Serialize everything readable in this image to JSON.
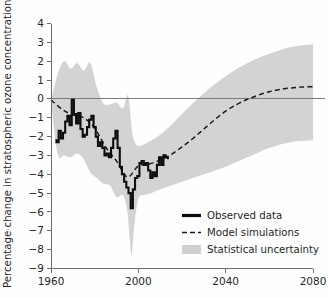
{
  "chart_data": {
    "type": "line",
    "title": "",
    "xlabel": "",
    "ylabel": "Percentage change in stratospheric ozone concentration",
    "xlim": [
      1960,
      2080
    ],
    "ylim": [
      -9,
      4
    ],
    "xticks": [
      1960,
      2000,
      2040,
      2080
    ],
    "xtick_labels": [
      "1960",
      "2000",
      "2040",
      "2080"
    ],
    "yticks": [
      4,
      3,
      2,
      1,
      0,
      -1,
      -2,
      -3,
      -4,
      -5,
      -6,
      -7,
      -8,
      -9
    ],
    "ytick_labels": [
      "4",
      "3",
      "2",
      "1",
      "0",
      "−1",
      "−2",
      "−3",
      "−4",
      "−5",
      "−6",
      "−7",
      "−8",
      "−9"
    ],
    "grid": false,
    "zero_line": 0,
    "legend_position": "lower-right",
    "colors": {
      "observed": "#0d0d0d",
      "model": "#1a1a1a",
      "uncertainty": "#cfcfcf",
      "axis": "#6e6e6e"
    },
    "legend": [
      {
        "key": "observed",
        "label": "Observed data",
        "style": "solid-thick"
      },
      {
        "key": "model",
        "label": "Model simulations",
        "style": "dashed"
      },
      {
        "key": "uncertainty",
        "label": "Statistical uncertainty",
        "style": "filled-band"
      }
    ],
    "series": [
      {
        "name": "Observed data",
        "style": "solid-thick",
        "x": [
          1962,
          1963,
          1964,
          1965,
          1966,
          1967,
          1968,
          1969,
          1970,
          1971,
          1972,
          1973,
          1974,
          1975,
          1976,
          1977,
          1978,
          1979,
          1980,
          1981,
          1982,
          1983,
          1984,
          1985,
          1986,
          1987,
          1988,
          1989,
          1990,
          1991,
          1992,
          1993,
          1994,
          1995,
          1996,
          1997,
          1998,
          1999,
          2000,
          2001,
          2002,
          2003,
          2004,
          2005,
          2006,
          2007,
          2008,
          2009,
          2010,
          2011,
          2012,
          2013,
          2014
        ],
        "y": [
          -2.2,
          -2.3,
          -1.7,
          -2.1,
          -1.8,
          -1.2,
          -0.9,
          -1.4,
          -0.05,
          -0.8,
          -1.3,
          -0.75,
          -1.6,
          -2.0,
          -1.9,
          -1.5,
          -1.1,
          -0.9,
          -1.5,
          -2.0,
          -2.5,
          -2.3,
          -2.6,
          -3.0,
          -2.9,
          -3.1,
          -2.6,
          -2.1,
          -1.7,
          -2.6,
          -3.6,
          -4.0,
          -4.4,
          -4.7,
          -5.0,
          -5.8,
          -4.8,
          -4.2,
          -4.1,
          -3.4,
          -3.3,
          -3.5,
          -3.4,
          -3.8,
          -4.2,
          -3.9,
          -4.1,
          -3.5,
          -3.1,
          -3.5,
          -3.0,
          -3.1,
          -3.15
        ]
      },
      {
        "name": "Model simulations",
        "style": "dashed",
        "x": [
          1960,
          1965,
          1970,
          1975,
          1980,
          1985,
          1990,
          1995,
          2000,
          2005,
          2010,
          2015,
          2020,
          2025,
          2030,
          2035,
          2040,
          2045,
          2050,
          2055,
          2060,
          2065,
          2070,
          2075,
          2080
        ],
        "y": [
          -0.05,
          -0.55,
          -0.85,
          -1.0,
          -1.55,
          -2.55,
          -3.3,
          -4.15,
          -3.55,
          -3.45,
          -3.25,
          -2.95,
          -2.55,
          -2.1,
          -1.6,
          -1.1,
          -0.65,
          -0.3,
          -0.02,
          0.2,
          0.38,
          0.5,
          0.58,
          0.63,
          0.65
        ]
      }
    ],
    "uncertainty_band": {
      "name": "Statistical uncertainty",
      "x": [
        1960,
        1963,
        1966,
        1969,
        1972,
        1975,
        1978,
        1981,
        1984,
        1987,
        1990,
        1993,
        1995,
        1996,
        1997,
        1998,
        2000,
        2003,
        2006,
        2010,
        2015,
        2020,
        2030,
        2040,
        2050,
        2060,
        2070,
        2080
      ],
      "upper": [
        -0.1,
        1.3,
        2.0,
        1.6,
        1.9,
        1.5,
        1.9,
        0.6,
        -0.25,
        -0.3,
        -0.2,
        -0.5,
        0.2,
        -0.4,
        -1.6,
        -2.2,
        -2.5,
        -2.4,
        -2.2,
        -1.9,
        -1.4,
        -0.8,
        0.3,
        1.2,
        1.9,
        2.4,
        2.75,
        2.9
      ],
      "lower": [
        -0.1,
        -2.9,
        -3.0,
        -3.1,
        -2.9,
        -3.2,
        -3.9,
        -4.2,
        -4.5,
        -4.6,
        -5.2,
        -5.1,
        -6.0,
        -7.4,
        -8.3,
        -6.9,
        -5.3,
        -5.1,
        -5.0,
        -4.8,
        -4.6,
        -4.4,
        -4.0,
        -3.6,
        -3.1,
        -2.6,
        -2.3,
        -2.2
      ]
    }
  }
}
